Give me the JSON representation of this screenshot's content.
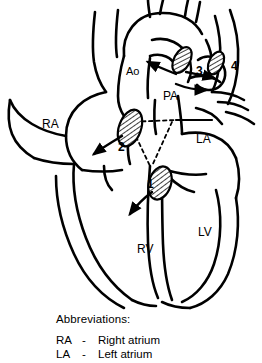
{
  "figure": {
    "kind": "anatomical-line-drawing",
    "chamber_labels": [
      {
        "id": "ra",
        "text": "RA",
        "x": 42,
        "y": 118
      },
      {
        "id": "la",
        "text": "LA",
        "x": 196,
        "y": 133
      },
      {
        "id": "rv",
        "text": "RV",
        "x": 137,
        "y": 243
      },
      {
        "id": "lv",
        "text": "LV",
        "x": 198,
        "y": 226
      }
    ],
    "vessel_labels": [
      {
        "id": "ao",
        "text": "Ao",
        "x": 126,
        "y": 65
      },
      {
        "id": "pa",
        "text": "PA",
        "x": 163,
        "y": 90
      }
    ],
    "numbered_markers": [
      {
        "id": "marker-1",
        "text": "1",
        "x": 147,
        "y": 178
      },
      {
        "id": "marker-2",
        "text": "2",
        "x": 118,
        "y": 141
      },
      {
        "id": "marker-3",
        "text": "3",
        "x": 196,
        "y": 65
      },
      {
        "id": "marker-4",
        "text": "4",
        "x": 231,
        "y": 60
      }
    ]
  },
  "legend": {
    "title": "Abbreviations:",
    "entries": [
      {
        "key": "RA",
        "dash": "-",
        "value": "Right atrium"
      },
      {
        "key": "LA",
        "dash": "-",
        "value": "Left atrium"
      }
    ]
  },
  "colors": {
    "ink": "#000000",
    "paper": "#ffffff"
  }
}
